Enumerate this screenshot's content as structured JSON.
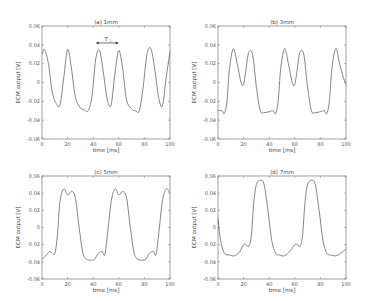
{
  "chart_data": [
    {
      "type": "line",
      "title": "(a) 1mm",
      "xlabel": "time [ms]",
      "ylabel": "ECM output [V]",
      "xlim": [
        0,
        100
      ],
      "ylim": [
        -0.06,
        0.06
      ],
      "xticks": [
        "0",
        "20",
        "40",
        "60",
        "80",
        "100"
      ],
      "yticks": [
        "0.06",
        "0.04",
        "0.02",
        "0",
        "-0.02",
        "-0.04",
        "-0.06"
      ],
      "annotation": {
        "text": "T",
        "subscript": "1",
        "x_from": 42,
        "x_to": 60,
        "y": 0.042
      },
      "x": [
        0,
        2,
        5,
        8,
        11,
        14,
        17,
        20,
        23,
        26,
        30,
        33,
        36,
        39,
        42,
        45,
        48,
        51,
        54,
        57,
        60,
        63,
        66,
        70,
        73,
        76,
        79,
        82,
        85,
        88,
        91,
        94,
        97,
        100
      ],
      "values": [
        0.03,
        0.035,
        0.02,
        -0.01,
        -0.022,
        -0.024,
        0.005,
        0.035,
        0.015,
        -0.015,
        -0.027,
        -0.029,
        -0.03,
        -0.015,
        0.025,
        0.034,
        0.01,
        -0.018,
        -0.024,
        0.01,
        0.034,
        0.015,
        -0.018,
        -0.028,
        -0.03,
        -0.03,
        -0.005,
        0.03,
        0.036,
        0.015,
        -0.015,
        -0.025,
        0.005,
        0.033
      ]
    },
    {
      "type": "line",
      "title": "(b) 3mm",
      "xlabel": "time [ms]",
      "ylabel": "ECM output [V]",
      "xlim": [
        0,
        100
      ],
      "ylim": [
        -0.06,
        0.06
      ],
      "xticks": [
        "0",
        "20",
        "40",
        "60",
        "80",
        "100"
      ],
      "yticks": [
        "0.06",
        "0.04",
        "0.02",
        "0",
        "-0.02",
        "-0.04",
        "-0.06"
      ],
      "x": [
        0,
        3,
        5,
        7,
        9,
        12,
        15,
        18,
        20,
        22,
        24,
        27,
        30,
        33,
        36,
        40,
        43,
        45,
        47,
        49,
        52,
        55,
        58,
        60,
        62,
        64,
        67,
        70,
        73,
        76,
        80,
        83,
        85,
        87,
        89,
        92,
        95,
        98,
        100
      ],
      "values": [
        -0.03,
        -0.03,
        -0.033,
        -0.02,
        0.015,
        0.036,
        0.02,
        0.0,
        -0.002,
        0.015,
        0.032,
        0.03,
        -0.005,
        -0.03,
        -0.032,
        -0.031,
        -0.03,
        -0.033,
        -0.02,
        0.015,
        0.036,
        0.02,
        0.0,
        -0.002,
        0.015,
        0.032,
        0.03,
        -0.005,
        -0.03,
        -0.032,
        -0.031,
        -0.03,
        -0.033,
        -0.02,
        0.015,
        0.036,
        0.02,
        0.005,
        -0.002
      ]
    },
    {
      "type": "line",
      "title": "(c) 5mm",
      "xlabel": "time [ms]",
      "ylabel": "ECM output [V]",
      "xlim": [
        0,
        100
      ],
      "ylim": [
        -0.06,
        0.06
      ],
      "xticks": [
        "0",
        "20",
        "40",
        "60",
        "80",
        "100"
      ],
      "yticks": [
        "0.06",
        "0.04",
        "0.02",
        "0",
        "-0.02",
        "-0.04",
        "-0.06"
      ],
      "x": [
        0,
        3,
        6,
        8,
        10,
        12,
        14,
        17,
        20,
        23,
        26,
        29,
        32,
        35,
        38,
        41,
        44,
        47,
        49,
        51,
        54,
        57,
        60,
        63,
        66,
        69,
        72,
        75,
        78,
        81,
        84,
        87,
        89,
        91,
        94,
        97,
        100
      ],
      "values": [
        -0.037,
        -0.033,
        -0.028,
        -0.03,
        -0.03,
        -0.01,
        0.03,
        0.045,
        0.038,
        0.042,
        0.035,
        0.0,
        -0.03,
        -0.037,
        -0.038,
        -0.037,
        -0.03,
        -0.028,
        -0.032,
        -0.01,
        0.03,
        0.045,
        0.038,
        0.042,
        0.035,
        0.0,
        -0.03,
        -0.037,
        -0.038,
        -0.037,
        -0.03,
        -0.028,
        -0.032,
        -0.01,
        0.03,
        0.045,
        0.04
      ]
    },
    {
      "type": "line",
      "title": "(d) 7mm",
      "xlabel": "time [ms]",
      "ylabel": "ECM output [V]",
      "xlim": [
        0,
        100
      ],
      "ylim": [
        -0.06,
        0.06
      ],
      "xticks": [
        "0",
        "20",
        "40",
        "60",
        "80",
        "100"
      ],
      "yticks": [
        "0.06",
        "0.04",
        "0.02",
        "0",
        "-0.02",
        "-0.04",
        "-0.06"
      ],
      "x": [
        0,
        2,
        5,
        9,
        13,
        17,
        20,
        22,
        24,
        26,
        28,
        30,
        33,
        36,
        39,
        42,
        45,
        48,
        52,
        56,
        60,
        62,
        64,
        66,
        68,
        70,
        73,
        76,
        79,
        82,
        85,
        88,
        92,
        96,
        100
      ],
      "values": [
        0.01,
        -0.015,
        -0.03,
        -0.032,
        -0.033,
        -0.028,
        -0.02,
        -0.02,
        -0.022,
        -0.01,
        0.03,
        0.05,
        0.055,
        0.05,
        0.02,
        -0.015,
        -0.03,
        -0.032,
        -0.033,
        -0.028,
        -0.02,
        -0.02,
        -0.022,
        -0.01,
        0.03,
        0.05,
        0.055,
        0.05,
        0.02,
        -0.015,
        -0.03,
        -0.032,
        -0.033,
        -0.03,
        -0.025
      ]
    }
  ]
}
